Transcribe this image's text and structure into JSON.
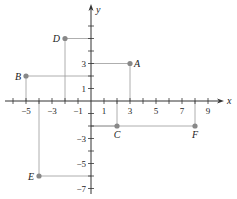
{
  "diagram": {
    "type": "coordinate-plane",
    "origin_px": [
      91,
      101
    ],
    "unit_px": [
      13,
      12.5
    ],
    "axes": {
      "x": {
        "label": "x",
        "min": -6,
        "max": 10
      },
      "y": {
        "label": "y",
        "min": -7,
        "max": 7
      }
    },
    "x_ticks": [
      -6,
      -5,
      -4,
      -3,
      -2,
      -1,
      1,
      2,
      3,
      4,
      5,
      6,
      7,
      8,
      9
    ],
    "x_tick_labels": [
      {
        "value": -5,
        "text": "−5"
      },
      {
        "value": -3,
        "text": "−3"
      },
      {
        "value": -1,
        "text": "−1"
      },
      {
        "value": 1,
        "text": "1"
      },
      {
        "value": 3,
        "text": "3"
      },
      {
        "value": 5,
        "text": "5"
      },
      {
        "value": 7,
        "text": "7"
      },
      {
        "value": 9,
        "text": "9"
      }
    ],
    "y_ticks": [
      -7,
      -6,
      -5,
      -4,
      -3,
      -2,
      -1,
      1,
      2,
      3,
      4,
      5,
      6
    ],
    "y_tick_labels": [
      {
        "value": 3,
        "text": "3"
      },
      {
        "value": 1,
        "text": "1"
      },
      {
        "value": -3,
        "text": "−3"
      },
      {
        "value": -5,
        "text": "−5"
      },
      {
        "value": -7,
        "text": "−7"
      }
    ],
    "points": [
      {
        "name": "A",
        "x": 3,
        "y": 3,
        "label_side": "right"
      },
      {
        "name": "B",
        "x": -5,
        "y": 2,
        "label_side": "left"
      },
      {
        "name": "C",
        "x": 2,
        "y": -2,
        "label_side": "below"
      },
      {
        "name": "D",
        "x": -2,
        "y": 5,
        "label_side": "left"
      },
      {
        "name": "E",
        "x": -4,
        "y": -6,
        "label_side": "left"
      },
      {
        "name": "F",
        "x": 8,
        "y": -2,
        "label_side": "below"
      }
    ],
    "colors": {
      "axis": "#333333",
      "guide": "#9a9a9a",
      "point": "#888888",
      "text": "#222222"
    }
  }
}
